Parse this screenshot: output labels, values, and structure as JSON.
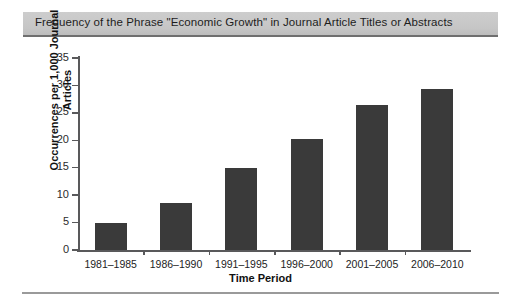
{
  "figure": {
    "caption": "Frequency of the Phrase \"Economic Growth\" in Journal Article Titles or Abstracts"
  },
  "chart_data": {
    "type": "bar",
    "title": "Frequency of the Phrase \"Economic Growth\" in Journal Article Titles or Abstracts",
    "categories": [
      "1981–1985",
      "1986–1990",
      "1991–1995",
      "1996–2000",
      "2001–2005",
      "2006–2010"
    ],
    "values": [
      5.0,
      8.5,
      15.0,
      20.2,
      26.5,
      29.3
    ],
    "xlabel": "Time Period",
    "ylabel": "Occurrences per 1,000 Journal Articles",
    "ylabel_line1": "Occurrences per 1,000 Journal",
    "ylabel_line2": "Articles",
    "ylim": [
      0,
      35
    ],
    "yticks": [
      0,
      5,
      10,
      15,
      20,
      25,
      30,
      35
    ],
    "ytick_labels": [
      "0",
      "5",
      "10",
      "15",
      "20",
      "25",
      "30",
      "35"
    ],
    "grid": false,
    "legend": false,
    "bar_color": "#3a3a3a",
    "axis_color": "#59595b"
  }
}
